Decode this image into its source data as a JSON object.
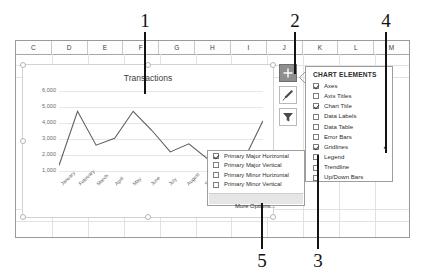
{
  "callouts": [
    {
      "id": "1",
      "label": "1"
    },
    {
      "id": "2",
      "label": "2"
    },
    {
      "id": "3",
      "label": "3"
    },
    {
      "id": "4",
      "label": "4"
    },
    {
      "id": "5",
      "label": "5"
    }
  ],
  "spreadsheet": {
    "column_headers": [
      "C",
      "D",
      "E",
      "F",
      "G",
      "H",
      "I",
      "J",
      "K",
      "L",
      "M"
    ]
  },
  "chart": {
    "title": "Transactions",
    "buttons": [
      {
        "name": "chart-elements",
        "icon": "plus-icon",
        "state": "active"
      },
      {
        "name": "chart-styles",
        "icon": "brush-icon",
        "state": "normal"
      },
      {
        "name": "chart-filters",
        "icon": "funnel-icon",
        "state": "normal"
      }
    ]
  },
  "chart_data": {
    "type": "line",
    "title": "Transactions",
    "xlabel": "",
    "ylabel": "",
    "categories": [
      "January",
      "February",
      "March",
      "April",
      "May",
      "June",
      "July",
      "August",
      "September",
      "October",
      "November",
      "December"
    ],
    "values": [
      1000,
      5000,
      2500,
      3000,
      5000,
      3600,
      2000,
      2600,
      1500,
      1500,
      1500,
      4300
    ],
    "ytick_labels": [
      "6,000",
      "5,000",
      "4,000",
      "3,000",
      "2,000",
      "1,000"
    ],
    "ytick_values": [
      6000,
      5000,
      4000,
      3000,
      2000,
      1000
    ],
    "ylim": [
      0,
      6500
    ],
    "grid": true,
    "legend": false,
    "series": [
      {
        "name": "Transactions",
        "values": [
          1000,
          5000,
          2500,
          3000,
          5000,
          3600,
          2000,
          2600,
          1500,
          1500,
          1500,
          4300
        ]
      }
    ]
  },
  "chart_elements_panel": {
    "title": "CHART ELEMENTS",
    "items": [
      {
        "label": "Axes",
        "checked": true,
        "submenu": false
      },
      {
        "label": "Axis Titles",
        "checked": false,
        "submenu": false
      },
      {
        "label": "Chart Title",
        "checked": true,
        "submenu": false
      },
      {
        "label": "Data Labels",
        "checked": false,
        "submenu": false
      },
      {
        "label": "Data Table",
        "checked": false,
        "submenu": false
      },
      {
        "label": "Error Bars",
        "checked": false,
        "submenu": false
      },
      {
        "label": "Gridlines",
        "checked": true,
        "submenu": true,
        "arrow": "▸"
      },
      {
        "label": "Legend",
        "checked": false,
        "submenu": false
      },
      {
        "label": "Trendline",
        "checked": false,
        "submenu": false
      },
      {
        "label": "Up/Down Bars",
        "checked": false,
        "submenu": false
      }
    ]
  },
  "gridlines_submenu": {
    "items": [
      {
        "label": "Primary Major Horizontal",
        "checked": true
      },
      {
        "label": "Primary Major Vertical",
        "checked": false
      },
      {
        "label": "Primary Minor Horizontal",
        "checked": false
      },
      {
        "label": "Primary Minor Vertical",
        "checked": false
      }
    ],
    "more_options": "More Options..."
  }
}
